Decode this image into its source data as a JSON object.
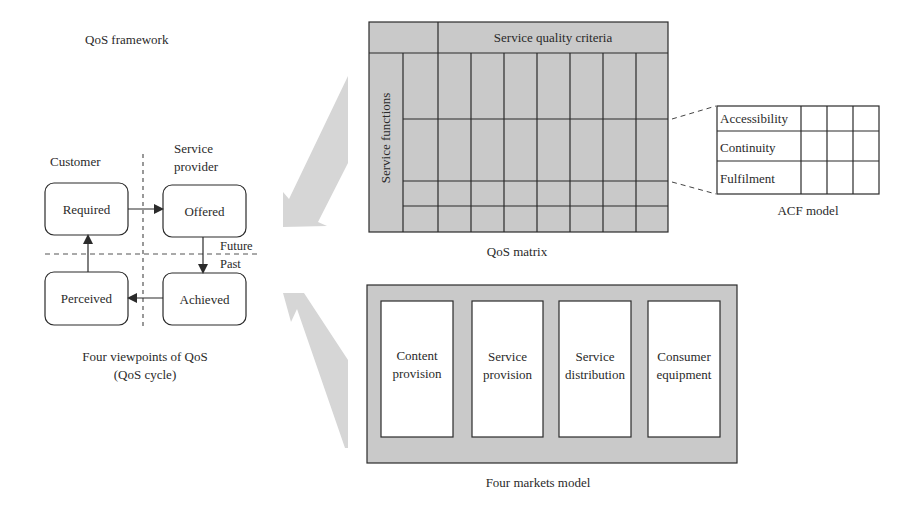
{
  "framework": {
    "title": "QoS framework"
  },
  "qos_cycle": {
    "caption_line1": "Four viewpoints of QoS",
    "caption_line2": "(QoS cycle)",
    "column_headers": {
      "customer": "Customer",
      "provider_line1": "Service",
      "provider_line2": "provider"
    },
    "time_labels": {
      "future": "Future",
      "past": "Past"
    },
    "nodes": {
      "required": "Required",
      "offered": "Offered",
      "achieved": "Achieved",
      "perceived": "Perceived"
    },
    "flow": [
      "Required",
      "Offered",
      "Achieved",
      "Perceived",
      "Required"
    ]
  },
  "qos_matrix": {
    "caption": "QoS matrix",
    "column_header": "Service quality criteria",
    "row_header": "Service functions",
    "criteria_columns": 7,
    "function_rows": 4
  },
  "acf_model": {
    "caption": "ACF model",
    "rows": [
      "Accessibility",
      "Continuity",
      "Fulfilment"
    ],
    "value_columns": 3
  },
  "four_markets": {
    "caption": "Four markets model",
    "markets": [
      {
        "line1": "Content",
        "line2": "provision"
      },
      {
        "line1": "Service",
        "line2": "provision"
      },
      {
        "line1": "Service",
        "line2": "distribution"
      },
      {
        "line1": "Consumer",
        "line2": "equipment"
      }
    ]
  },
  "colors": {
    "panel_fill": "#c9c9c9",
    "line": "#2b2b2b",
    "arrow_fill": "#d6d6d6",
    "text": "#2a2a2a"
  }
}
